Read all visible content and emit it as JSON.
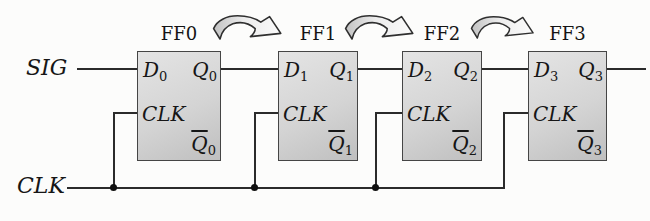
{
  "figure": {
    "sig_label": "SIG",
    "clk_label": "CLK",
    "flip_flops": [
      {
        "title": "FF0",
        "d": "D",
        "d_sub": "0",
        "q": "Q",
        "q_sub": "0",
        "clk": "CLK",
        "qbar": "Q",
        "qbar_sub": "0"
      },
      {
        "title": "FF1",
        "d": "D",
        "d_sub": "1",
        "q": "Q",
        "q_sub": "1",
        "clk": "CLK",
        "qbar": "Q",
        "qbar_sub": "1"
      },
      {
        "title": "FF2",
        "d": "D",
        "d_sub": "2",
        "q": "Q",
        "q_sub": "2",
        "clk": "CLK",
        "qbar": "Q",
        "qbar_sub": "2"
      },
      {
        "title": "FF3",
        "d": "D",
        "d_sub": "3",
        "q": "Q",
        "q_sub": "3",
        "clk": "CLK",
        "qbar": "Q",
        "qbar_sub": "3"
      }
    ],
    "icons": {
      "shift_arrow": "curved-hop-arrow"
    },
    "colors": {
      "background": "#fcfcfb",
      "box_fill_light": "#e4e4e4",
      "box_fill_dark": "#bfbfbf",
      "box_border": "#454545",
      "wire": "#2b2b2b",
      "text": "#161616",
      "arrow_fill_left": "#c2c2c2",
      "arrow_fill_right": "#fbfbfb"
    }
  }
}
